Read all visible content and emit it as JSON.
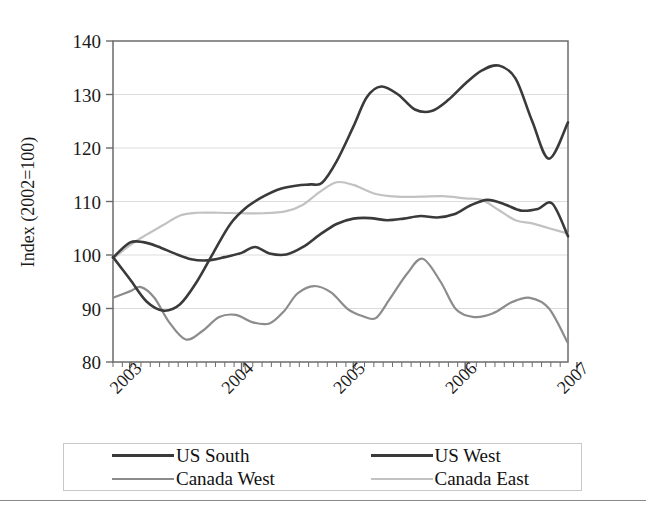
{
  "chart_data": {
    "type": "line",
    "title": "",
    "subtitle": "",
    "xlabel": "",
    "ylabel": "Index (2002=100)",
    "ylim": [
      80,
      140
    ],
    "xlim": [
      2002.85,
      2006.92
    ],
    "ytick_labels": [
      "140",
      "130",
      "120",
      "110",
      "100",
      "90",
      "80"
    ],
    "yticks": [
      140,
      130,
      120,
      110,
      100,
      90,
      80
    ],
    "xtick_labels": [
      "2003",
      "2004",
      "2005",
      "2006",
      "2007"
    ],
    "xticks": [
      2003,
      2004,
      2005,
      2006,
      2007
    ],
    "xtick_rotation_deg": -45,
    "grid": "horizontal",
    "legend_position": "below-plot",
    "legend_columns": 2,
    "series": [
      {
        "name": "US South",
        "color": "#3a3a3a",
        "x": [
          2002.85,
          2003.0,
          2003.12,
          2003.25,
          2003.4,
          2003.55,
          2003.7,
          2003.85,
          2004.0,
          2004.12,
          2004.25,
          2004.4,
          2004.55,
          2004.7,
          2004.85,
          2005.0,
          2005.15,
          2005.3,
          2005.45,
          2005.6,
          2005.75,
          2005.9,
          2006.05,
          2006.2,
          2006.35,
          2006.5,
          2006.65,
          2006.78,
          2006.92
        ],
        "y": [
          99.5,
          102.3,
          102.4,
          101.6,
          100.3,
          99.2,
          99.0,
          99.6,
          100.4,
          101.5,
          100.3,
          100.1,
          101.5,
          103.8,
          105.8,
          106.8,
          106.9,
          106.5,
          106.8,
          107.3,
          107.0,
          107.6,
          109.3,
          110.3,
          109.5,
          108.3,
          108.6,
          109.6,
          103.5
        ]
      },
      {
        "name": "US West",
        "color": "#3a3a3a",
        "x": [
          2002.85,
          2003.0,
          2003.15,
          2003.3,
          2003.45,
          2003.6,
          2003.75,
          2003.9,
          2004.05,
          2004.2,
          2004.35,
          2004.5,
          2004.62,
          2004.72,
          2004.85,
          2005.0,
          2005.12,
          2005.25,
          2005.4,
          2005.55,
          2005.7,
          2005.85,
          2006.0,
          2006.15,
          2006.3,
          2006.45,
          2006.6,
          2006.75,
          2006.92
        ],
        "y": [
          99.6,
          95.5,
          91.3,
          89.6,
          90.8,
          95.0,
          100.5,
          105.8,
          109.0,
          111.0,
          112.4,
          113.0,
          113.2,
          113.5,
          117.5,
          124.0,
          129.5,
          131.5,
          130.0,
          127.2,
          126.9,
          129.0,
          132.0,
          134.5,
          135.4,
          133.0,
          125.0,
          118.0,
          124.8
        ]
      },
      {
        "name": "Canada West",
        "color": "#8c8c8c",
        "x": [
          2002.85,
          2003.0,
          2003.1,
          2003.22,
          2003.35,
          2003.5,
          2003.65,
          2003.8,
          2003.95,
          2004.1,
          2004.25,
          2004.38,
          2004.5,
          2004.65,
          2004.8,
          2004.95,
          2005.08,
          2005.2,
          2005.32,
          2005.48,
          2005.62,
          2005.78,
          2005.92,
          2006.08,
          2006.25,
          2006.42,
          2006.58,
          2006.75,
          2006.92
        ],
        "y": [
          92.0,
          93.2,
          94.0,
          92.0,
          87.5,
          84.2,
          85.8,
          88.4,
          88.8,
          87.4,
          87.2,
          89.5,
          92.8,
          94.2,
          93.0,
          89.9,
          88.6,
          88.2,
          91.6,
          96.5,
          99.3,
          95.0,
          89.8,
          88.4,
          89.1,
          91.2,
          92.0,
          90.0,
          83.5
        ]
      },
      {
        "name": "Canada East",
        "color": "#c2c2c2",
        "x": [
          2002.85,
          2003.0,
          2003.15,
          2003.3,
          2003.45,
          2003.6,
          2003.8,
          2004.0,
          2004.2,
          2004.4,
          2004.55,
          2004.7,
          2004.85,
          2005.0,
          2005.2,
          2005.4,
          2005.6,
          2005.8,
          2006.0,
          2006.15,
          2006.3,
          2006.45,
          2006.6,
          2006.75,
          2006.92
        ],
        "y": [
          99.3,
          101.8,
          103.8,
          105.6,
          107.4,
          107.9,
          107.9,
          107.8,
          107.8,
          108.2,
          109.4,
          111.8,
          113.6,
          113.1,
          111.4,
          110.9,
          110.9,
          111.0,
          110.6,
          110.3,
          108.4,
          106.5,
          105.9,
          105.0,
          104.0
        ]
      }
    ]
  },
  "legend": {
    "items": [
      {
        "label": "US South",
        "color": "#3a3a3a",
        "thickness": "3px"
      },
      {
        "label": "US West",
        "color": "#3a3a3a",
        "thickness": "3px"
      },
      {
        "label": "Canada West",
        "color": "#8c8c8c",
        "thickness": "2px"
      },
      {
        "label": "Canada East",
        "color": "#c2c2c2",
        "thickness": "2px"
      }
    ]
  },
  "style": {
    "plot_border_color": "#6b6b6b",
    "grid_color": "#dcdcdc",
    "background": "#ffffff"
  }
}
